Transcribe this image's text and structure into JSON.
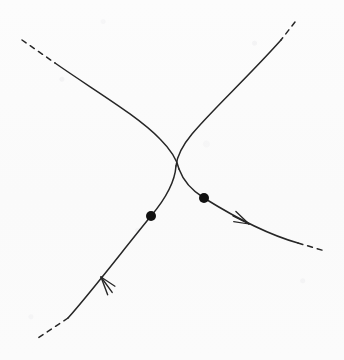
{
  "figure": {
    "kind": "mathematical-curve-diagram",
    "title": "Two crossing trajectory branches with marked points and direction arrows",
    "canvas": {
      "width": 344,
      "height": 360
    },
    "colors": {
      "background": "#fbfbfb",
      "stroke": "#262626",
      "dot_fill": "#111111"
    },
    "stroke_width": 1.5,
    "dash_pattern": "5 5"
  },
  "chart_data": {
    "type": "line",
    "title": "Two crossing trajectory branches with marked points and direction arrows",
    "xlabel": "",
    "ylabel": "",
    "xlim": [
      0,
      344
    ],
    "ylim": [
      0,
      360
    ],
    "grid": false,
    "legend": "none",
    "axes_visible": false,
    "series": [
      {
        "name": "branch-a",
        "description": "Enters from upper-left, bends through the waist, exits to lower-right past the arrow",
        "style": "solid-with-dashed-ends",
        "x": [
          22,
          38,
          55,
          72,
          92,
          112,
          132,
          150,
          163,
          171,
          176,
          179,
          186,
          196,
          204,
          216,
          232,
          250,
          268,
          284,
          298,
          312,
          325
        ],
        "y": [
          40,
          52,
          63,
          73,
          85,
          97,
          111,
          127,
          140,
          150,
          158,
          164,
          175,
          190,
          198,
          206,
          215,
          225,
          232,
          238,
          243,
          247,
          251
        ]
      },
      {
        "name": "branch-b",
        "description": "Enters from upper-right, bends through the waist, exits to lower-left past the arrow",
        "style": "solid-with-dashed-ends",
        "x": [
          295,
          288,
          281,
          268,
          252,
          236,
          222,
          208,
          196,
          188,
          183,
          180,
          176,
          168,
          160,
          151,
          136,
          118,
          100,
          84,
          68,
          52,
          38
        ],
        "y": [
          22,
          31,
          40,
          56,
          73,
          89,
          103,
          118,
          132,
          142,
          150,
          157,
          166,
          182,
          200,
          216,
          234,
          256,
          278,
          298,
          318,
          328,
          338
        ]
      }
    ],
    "annotations": [
      {
        "name": "crossing-point",
        "kind": "curve-intersection",
        "x": 178,
        "y": 157,
        "label": ""
      },
      {
        "name": "marked-point-left",
        "kind": "filled-dot",
        "x": 151,
        "y": 216,
        "radius": 5,
        "on_series": "branch-b",
        "label": ""
      },
      {
        "name": "marked-point-right",
        "kind": "filled-dot",
        "x": 204,
        "y": 198,
        "radius": 5,
        "on_series": "branch-a",
        "label": ""
      },
      {
        "name": "direction-arrow-lower-left",
        "kind": "arrowhead",
        "x": 101,
        "y": 277,
        "angle_deg": 229,
        "on_series": "branch-b",
        "label": ""
      },
      {
        "name": "direction-arrow-lower-right",
        "kind": "arrowhead",
        "x": 249,
        "y": 224,
        "angle_deg": 27,
        "on_series": "branch-a",
        "label": ""
      }
    ],
    "dashed_segments": [
      {
        "name": "dash-upper-left",
        "from": [
          22,
          40
        ],
        "to": [
          55,
          63
        ]
      },
      {
        "name": "dash-upper-right",
        "from": [
          295,
          22
        ],
        "to": [
          281,
          40
        ]
      },
      {
        "name": "dash-lower-left",
        "from": [
          68,
          318
        ],
        "to": [
          38,
          338
        ]
      },
      {
        "name": "dash-lower-right",
        "from": [
          298,
          243
        ],
        "to": [
          325,
          251
        ]
      }
    ]
  }
}
